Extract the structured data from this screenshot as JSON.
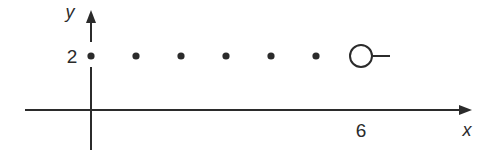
{
  "chart_data": {
    "type": "scatter",
    "title": "",
    "xlabel": "x",
    "ylabel": "y",
    "x_tick_labels": [
      {
        "value": 6,
        "label": "6"
      }
    ],
    "y_tick_labels": [
      {
        "value": 2,
        "label": "2"
      }
    ],
    "xlim": [
      -1.5,
      8.5
    ],
    "ylim": [
      -1,
      3
    ],
    "grid": false,
    "legend": null,
    "series": [
      {
        "name": "closed points",
        "marker": "filled-dot",
        "points": [
          {
            "x": 0,
            "y": 2
          },
          {
            "x": 1,
            "y": 2
          },
          {
            "x": 2,
            "y": 2
          },
          {
            "x": 3,
            "y": 2
          },
          {
            "x": 4,
            "y": 2
          },
          {
            "x": 5,
            "y": 2
          }
        ]
      },
      {
        "name": "open endpoint",
        "marker": "open-circle",
        "points": [
          {
            "x": 6,
            "y": 2
          }
        ],
        "continues_right": true
      }
    ],
    "colors": {
      "ink": "#2b2b2b",
      "background": "#ffffff"
    }
  }
}
